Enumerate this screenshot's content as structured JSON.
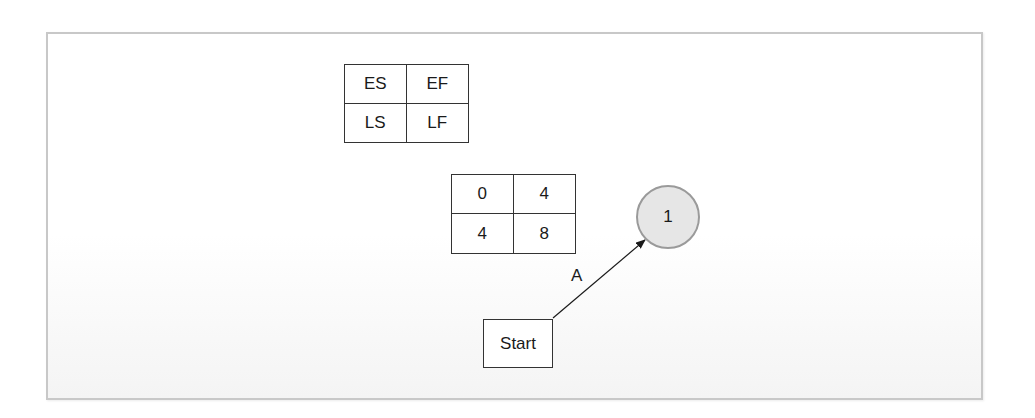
{
  "legend_box": {
    "cells": [
      "ES",
      "EF",
      "LS",
      "LF"
    ]
  },
  "activity_values": {
    "cells": [
      "0",
      "4",
      "4",
      "8"
    ]
  },
  "nodes": {
    "start": {
      "label": "Start"
    },
    "node_1": {
      "label": "1",
      "fill": "#e6e6e6",
      "stroke": "#9a9a9a"
    }
  },
  "edges": [
    {
      "from": "Start",
      "to": "1",
      "label": "A"
    }
  ]
}
